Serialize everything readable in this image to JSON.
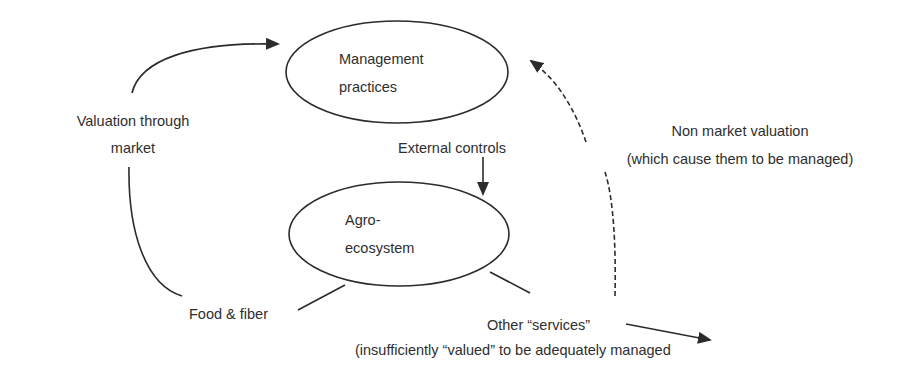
{
  "diagram": {
    "type": "flow-diagram",
    "colors": {
      "stroke": "#2b2b2b",
      "text": "#2e2e2e",
      "background": "#ffffff"
    },
    "nodes": {
      "management": {
        "line1": "Management",
        "line2": "practices"
      },
      "agro": {
        "line1": "Agro-",
        "line2": "ecosystem"
      }
    },
    "labels": {
      "valuation_market_line1": "Valuation through",
      "valuation_market_line2": "market",
      "external_controls": "External controls",
      "non_market_line1": "Non market valuation",
      "non_market_line2": "(which cause them to be managed)",
      "food_fiber": "Food & fiber",
      "other_services_line1": "Other “services”",
      "other_services_line2": "(insufficiently “valued” to be adequately managed"
    },
    "edges": [
      {
        "from": "agro",
        "to": "management",
        "via": "Food & fiber / Valuation through market",
        "style": "solid"
      },
      {
        "from": "External controls",
        "to": "agro",
        "style": "solid"
      },
      {
        "from": "agro",
        "to": "Other services",
        "via": "Non market valuation",
        "to_final": "management",
        "style": "dashed"
      },
      {
        "from": "Other services",
        "to": "outside",
        "style": "solid"
      }
    ]
  }
}
